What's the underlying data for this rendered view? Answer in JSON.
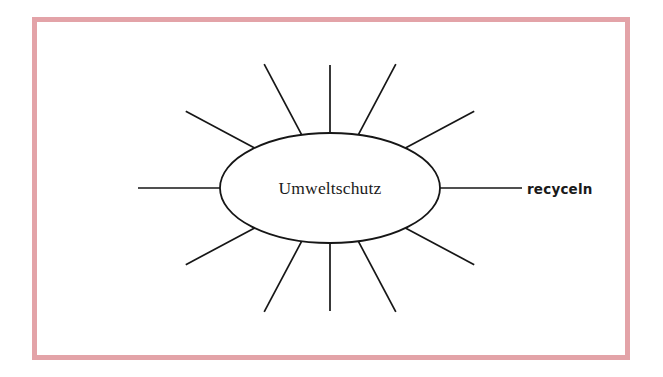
{
  "document": {
    "type": "word-web-worksheet",
    "language": "de",
    "page_background": "#ffffff",
    "frame_color": "#e3a3a8",
    "ink_color": "#161616"
  },
  "diagram": {
    "name": "wortigel",
    "center": {
      "label": "Umweltschutz",
      "cx": 330,
      "cy": 188,
      "rx": 110,
      "ry": 55,
      "fill": "#ffffff",
      "stroke": "#161616"
    },
    "rays": [
      {
        "id": "ray-w",
        "name": "ray-west",
        "angle_deg": 180,
        "length": 82,
        "label": ""
      },
      {
        "id": "ray-wnw",
        "name": "ray-west-northwest",
        "angle_deg": 208,
        "length": 78,
        "label": ""
      },
      {
        "id": "ray-nnw",
        "name": "ray-north-northwest",
        "angle_deg": 242,
        "length": 80,
        "label": ""
      },
      {
        "id": "ray-n",
        "name": "ray-north",
        "angle_deg": 270,
        "length": 68,
        "label": ""
      },
      {
        "id": "ray-nne",
        "name": "ray-north-northeast",
        "angle_deg": 298,
        "length": 80,
        "label": ""
      },
      {
        "id": "ray-ene",
        "name": "ray-east-northeast",
        "angle_deg": 332,
        "length": 78,
        "label": ""
      },
      {
        "id": "ray-e",
        "name": "ray-east",
        "angle_deg": 0,
        "length": 82,
        "label": "recyceln"
      },
      {
        "id": "ray-ese",
        "name": "ray-east-southeast",
        "angle_deg": 28,
        "length": 78,
        "label": ""
      },
      {
        "id": "ray-sse",
        "name": "ray-south-southeast",
        "angle_deg": 62,
        "length": 80,
        "label": ""
      },
      {
        "id": "ray-s",
        "name": "ray-south",
        "angle_deg": 90,
        "length": 68,
        "label": ""
      },
      {
        "id": "ray-ssw",
        "name": "ray-south-southwest",
        "angle_deg": 118,
        "length": 80,
        "label": ""
      },
      {
        "id": "ray-wsw",
        "name": "ray-west-southwest",
        "angle_deg": 152,
        "length": 78,
        "label": ""
      }
    ],
    "ray_count": 12,
    "filled_labels": [
      "recyceln"
    ],
    "labels": {
      "recyceln": {
        "x": 527,
        "y": 194
      }
    }
  }
}
